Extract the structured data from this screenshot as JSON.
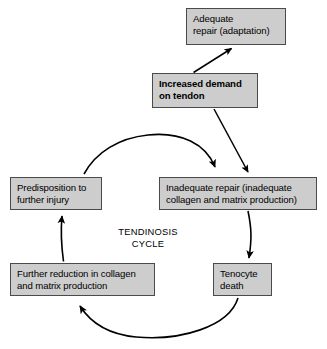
{
  "diagram": {
    "center_label": "TENDINOSIS\nCYCLE",
    "colors": {
      "node_fill": "#cdcdcd",
      "node_border": "#4a4a4a",
      "arrow": "#000000",
      "background": "#ffffff",
      "text": "#000000"
    },
    "nodes": [
      {
        "id": "increased-demand",
        "label": "Increased demand\non tendon",
        "bold": true
      },
      {
        "id": "adequate-repair",
        "label": "Adequate\nrepair (adaptation)",
        "bold": false
      },
      {
        "id": "inadequate-repair",
        "label": "Inadequate repair (inadequate\ncollagen and matrix production)",
        "bold": false
      },
      {
        "id": "tenocyte-death",
        "label": "Tenocyte\ndeath",
        "bold": false
      },
      {
        "id": "further-reduction",
        "label": "Further reduction in collagen\nand matrix production",
        "bold": false
      },
      {
        "id": "predisposition",
        "label": "Predisposition to\nfurther injury",
        "bold": false
      }
    ],
    "edges": [
      {
        "id": "demand-to-adequate",
        "from": "increased-demand",
        "to": "adequate-repair",
        "style": "straight"
      },
      {
        "id": "demand-to-inadequate",
        "from": "increased-demand",
        "to": "inadequate-repair",
        "style": "straight"
      },
      {
        "id": "inadequate-to-tenocyte",
        "from": "inadequate-repair",
        "to": "tenocyte-death",
        "style": "curved"
      },
      {
        "id": "tenocyte-to-further",
        "from": "tenocyte-death",
        "to": "further-reduction",
        "style": "arc"
      },
      {
        "id": "further-to-predisposition",
        "from": "further-reduction",
        "to": "predisposition",
        "style": "curved"
      },
      {
        "id": "predisposition-to-inadequate",
        "from": "predisposition",
        "to": "inadequate-repair",
        "style": "arc"
      }
    ]
  }
}
